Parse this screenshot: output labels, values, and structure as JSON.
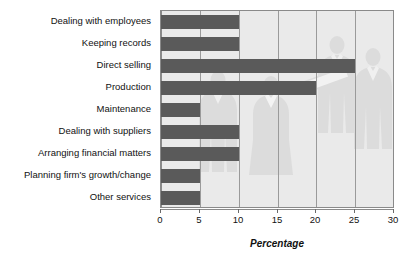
{
  "chart_data": {
    "type": "bar",
    "orientation": "horizontal",
    "title": "",
    "subtitle": "",
    "xlabel": "Percentage",
    "ylabel": "",
    "xlim": [
      0,
      30
    ],
    "xticks": [
      0,
      5,
      10,
      15,
      20,
      25,
      30
    ],
    "xtick_labels": [
      "0",
      "5",
      "10",
      "15",
      "20",
      "25",
      "30"
    ],
    "grid": true,
    "grid_axis": "x",
    "legend": false,
    "legend_position": "none",
    "categories": [
      "Dealing with employees",
      "Keeping records",
      "Direct selling",
      "Production",
      "Maintenance",
      "Dealing with suppliers",
      "Arranging financial matters",
      "Planning firm's growth/change",
      "Other services"
    ],
    "values": [
      10,
      10,
      25,
      20,
      5,
      10,
      10,
      5,
      5
    ],
    "series": [
      {
        "name": "Percentage",
        "values": [
          10,
          10,
          25,
          20,
          5,
          10,
          10,
          5,
          5
        ]
      }
    ],
    "annotations": []
  },
  "style": {
    "bar_color": "#5a5a5a",
    "plot_background": "#eaeaea",
    "page_background": "#ffffff",
    "gridline_color": "#9a9a9a",
    "axis_color": "#8a8a8a",
    "text_color": "#111111",
    "watermark_color": "#d8d8d8"
  },
  "watermark": {
    "name": "business-people-silhouettes",
    "description": "faint grey silhouettes of business people in the plot background"
  }
}
